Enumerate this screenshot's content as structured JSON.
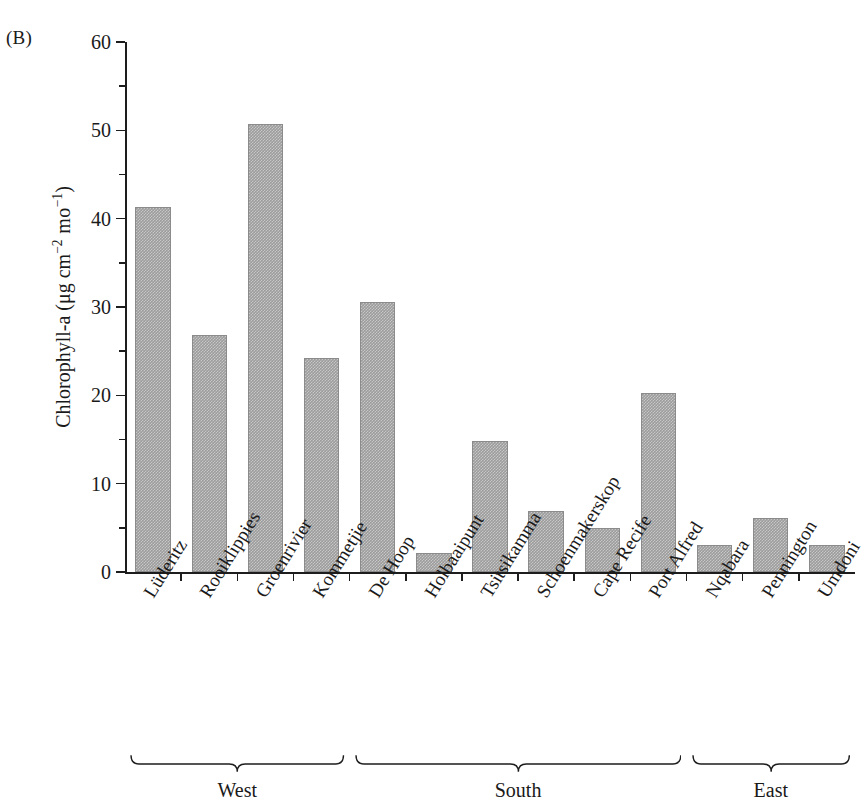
{
  "panel": {
    "label": "(B)"
  },
  "chart_data": {
    "type": "bar",
    "title": "",
    "xlabel": "",
    "ylabel": "Chlorophyll-a (μg cm⁻² mo⁻¹)",
    "ylabel_parts": {
      "main": "Chlorophyll-a (μg cm",
      "sup1": "−2",
      "mid": " mo",
      "sup2": "−1",
      "end": ")"
    },
    "ylim": [
      0,
      60
    ],
    "yticks": [
      0,
      10,
      20,
      30,
      40,
      50,
      60
    ],
    "ytick_labels": [
      "0",
      "10",
      "20",
      "30",
      "40",
      "50",
      "60"
    ],
    "yminor_ticks": [
      5,
      15,
      25,
      35,
      45,
      55
    ],
    "grid": false,
    "legend": "none",
    "bar_color": "#9c9c9c",
    "axis_color": "#1d1d1d",
    "categories": [
      "Lüderitz",
      "Rooiklippies",
      "Groenrivier",
      "Kommetjie",
      "De Hoop",
      "Holbaaipunt",
      "Tsitsikamma",
      "Schoenmakerskop",
      "Cape Recife",
      "Port Alfred",
      "Nqabara",
      "Pennington",
      "Umdoni"
    ],
    "values": [
      41.3,
      26.8,
      50.7,
      24.2,
      30.6,
      2.2,
      14.8,
      6.9,
      5.0,
      20.3,
      3.1,
      6.1,
      3.1
    ],
    "groups": [
      {
        "label": "West",
        "start_index": 0,
        "end_index": 3
      },
      {
        "label": "South",
        "start_index": 4,
        "end_index": 9
      },
      {
        "label": "East",
        "start_index": 10,
        "end_index": 12
      }
    ]
  }
}
